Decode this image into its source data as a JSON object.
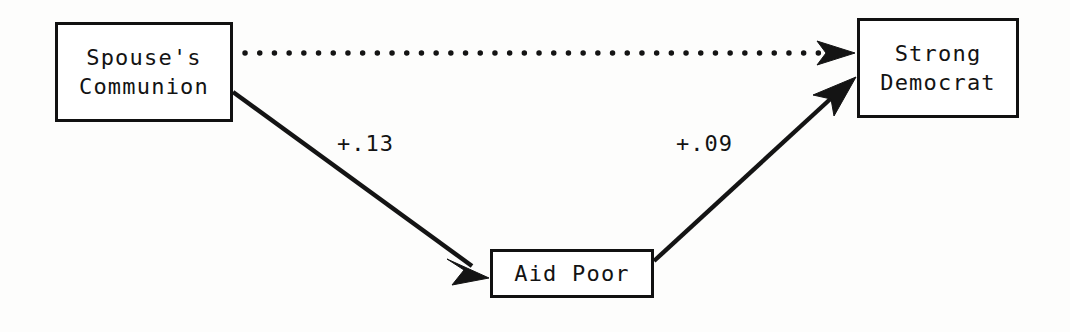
{
  "figure": {
    "type": "path-diagram",
    "background_color": "#fdfdfc",
    "ink_color": "#131313"
  },
  "nodes": [
    {
      "id": "spouse-communion",
      "lines": [
        "Spouse's",
        "Communion"
      ],
      "line1": "Spouse's",
      "line2": "Communion"
    },
    {
      "id": "aid-poor",
      "lines": [
        "Aid Poor"
      ],
      "line1": "Aid Poor"
    },
    {
      "id": "strong-democrat",
      "lines": [
        "Strong",
        "Democrat"
      ],
      "line1": "Strong",
      "line2": "Democrat"
    }
  ],
  "edges": [
    {
      "id": "communion-to-democrat",
      "from": "spouse-communion",
      "to": "strong-democrat",
      "style": "dotted",
      "label": ""
    },
    {
      "id": "communion-to-aidpoor",
      "from": "spouse-communion",
      "to": "aid-poor",
      "style": "solid",
      "label": "+.13"
    },
    {
      "id": "aidpoor-to-democrat",
      "from": "aid-poor",
      "to": "strong-democrat",
      "style": "solid",
      "label": "+.09"
    }
  ]
}
